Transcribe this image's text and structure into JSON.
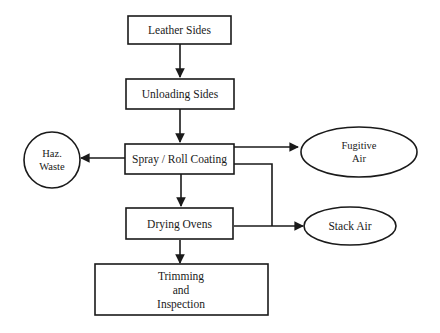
{
  "diagram": {
    "type": "process-flowchart",
    "colors": {
      "stroke": "#1a1a1a",
      "fill": "#ffffff",
      "text": "#1a1a1a"
    },
    "nodes": {
      "leather_sides": {
        "label": "Leather Sides",
        "shape": "rectangle"
      },
      "unloading_sides": {
        "label": "Unloading Sides",
        "shape": "rectangle"
      },
      "spray_roll_coating": {
        "label": "Spray / Roll Coating",
        "shape": "rectangle"
      },
      "drying_ovens": {
        "label": "Drying Ovens",
        "shape": "rectangle"
      },
      "trimming_inspection": {
        "label_lines": [
          "Trimming",
          "and",
          "Inspection"
        ],
        "shape": "rectangle"
      },
      "haz_waste": {
        "label_lines": [
          "Haz.",
          "Waste"
        ],
        "shape": "circle"
      },
      "fugitive_air": {
        "label_lines": [
          "Fugitive",
          "Air"
        ],
        "shape": "ellipse"
      },
      "stack_air": {
        "label": "Stack Air",
        "shape": "ellipse"
      }
    },
    "edges": [
      {
        "from": "Leather Sides",
        "to": "Unloading Sides"
      },
      {
        "from": "Unloading Sides",
        "to": "Spray / Roll Coating"
      },
      {
        "from": "Spray / Roll Coating",
        "to": "Haz. Waste"
      },
      {
        "from": "Spray / Roll Coating",
        "to": "Fugitive Air"
      },
      {
        "from": "Spray / Roll Coating",
        "to": "Stack Air"
      },
      {
        "from": "Spray / Roll Coating",
        "to": "Drying Ovens"
      },
      {
        "from": "Drying Ovens",
        "to": "Stack Air"
      },
      {
        "from": "Drying Ovens",
        "to": "Trimming and Inspection"
      }
    ]
  }
}
